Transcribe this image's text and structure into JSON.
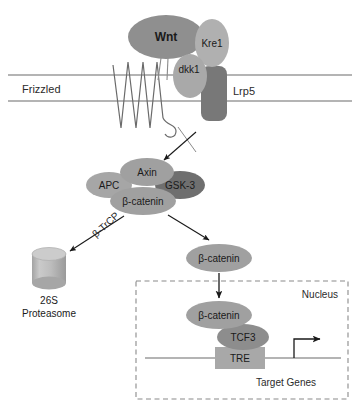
{
  "figure": {
    "background": "#ffffff"
  },
  "palette": {
    "ellipse_mid": "#9b9b9b",
    "ellipse_light": "#b8b8b8",
    "ellipse_dark": "#6f6f6f",
    "receptor_dark": "#787878",
    "box_fill": "#a8a8a8",
    "proteasome_fill": "#b5b5b5",
    "proteasome_top": "#c9c9c9",
    "line": "#6a6a6a",
    "arrow": "#1a1a1a",
    "dashed_border": "#8a8a8a",
    "text": "#1a1a1a"
  },
  "membrane": {
    "name": "plasma-membrane",
    "outer_y": 75,
    "inner_y": 101,
    "x_start": 8,
    "x_end": 352
  },
  "receptors": {
    "frizzled": {
      "label": "Frizzled",
      "label_x": 22,
      "label_y": 93,
      "font_size": 11
    },
    "lrp5": {
      "label": "Lrp5",
      "label_x": 233,
      "label_y": 95,
      "font_size": 11,
      "box": {
        "x": 201,
        "y": 66,
        "w": 26,
        "h": 55,
        "rx": 8
      }
    }
  },
  "ligands": [
    {
      "name": "wnt-ellipse",
      "label": "Wnt",
      "cx": 166,
      "cy": 37,
      "rx": 38,
      "ry": 22,
      "fill": "#8f8f8f",
      "font_size": 12,
      "bold": true
    },
    {
      "name": "kre1-ellipse",
      "label": "Kre1",
      "cx": 212,
      "cy": 43,
      "rx": 17,
      "ry": 24,
      "fill": "#b0b0b0",
      "font_size": 10,
      "bold": false
    },
    {
      "name": "dkk1-ellipse",
      "label": "dkk1",
      "cx": 190,
      "cy": 76,
      "rx": 17,
      "ry": 22,
      "fill": "#a9a9a9",
      "font_size": 10,
      "bold": false
    }
  ],
  "destruction_complex": [
    {
      "name": "apc-ellipse",
      "label": "APC",
      "cx": 109,
      "cy": 185,
      "rx": 23,
      "ry": 13,
      "fill": "#a6a6a6",
      "font_size": 10
    },
    {
      "name": "axin-ellipse",
      "label": "Axin",
      "cx": 147,
      "cy": 172,
      "rx": 27,
      "ry": 14,
      "fill": "#a0a0a0",
      "font_size": 10
    },
    {
      "name": "gsk3-ellipse",
      "label": "GSK-3",
      "cx": 180,
      "cy": 185,
      "rx": 25,
      "ry": 14,
      "fill": "#6f6f6f",
      "font_size": 10
    },
    {
      "name": "beta-catenin-complex-ellipse",
      "label": "β-catenin",
      "cx": 143,
      "cy": 201,
      "rx": 33,
      "ry": 14,
      "fill": "#a0a0a0",
      "font_size": 10
    }
  ],
  "cytoplasmic_beta_catenin": {
    "name": "beta-catenin-free-ellipse",
    "label": "β-catenin",
    "cx": 219,
    "cy": 258,
    "rx": 33,
    "ry": 14,
    "fill": "#a0a0a0",
    "font_size": 10
  },
  "degradation": {
    "arrow_label": "β-TrCP",
    "arrow_label_x": 96,
    "arrow_label_y": 238,
    "arrow_label_rotation": -42,
    "font_size": 10,
    "proteasome": {
      "name": "proteasome-cylinder",
      "x": 32,
      "y": 247,
      "w": 34,
      "h": 42,
      "caption_line1": "26S",
      "caption_line2": "Proteasome",
      "caption_x": 49,
      "caption_line1_y": 300,
      "caption_line2_y": 313,
      "font_size": 10
    }
  },
  "nucleus": {
    "name": "nucleus-compartment",
    "label": "Nucleus",
    "label_x": 338,
    "label_y": 295,
    "font_size": 10,
    "box": {
      "x": 136,
      "y": 281,
      "w": 212,
      "h": 118
    },
    "target_genes_label": "Target Genes",
    "target_genes_x": 286,
    "target_genes_y": 386,
    "nodes": [
      {
        "name": "beta-catenin-nuclear-ellipse",
        "label": "β-catenin",
        "cx": 219,
        "cy": 315,
        "rx": 33,
        "ry": 14,
        "fill": "#a0a0a0",
        "font_size": 10
      },
      {
        "name": "tcf3-ellipse",
        "label": "TCF3",
        "cx": 243,
        "cy": 337,
        "rx": 26,
        "ry": 13,
        "fill": "#8d8d8d",
        "font_size": 10
      }
    ],
    "tre": {
      "name": "tre-box",
      "label": "TRE",
      "x": 215,
      "y": 347,
      "w": 50,
      "h": 22,
      "fill": "#a8a8a8",
      "font_size": 10
    },
    "dna_line": {
      "x_start": 145,
      "x_end": 341,
      "y": 358
    },
    "transcription_arrow": {
      "name": "transcription-start-arrow",
      "vertical_x": 294,
      "base_y": 358,
      "top_y": 339,
      "tip_x": 326
    }
  }
}
